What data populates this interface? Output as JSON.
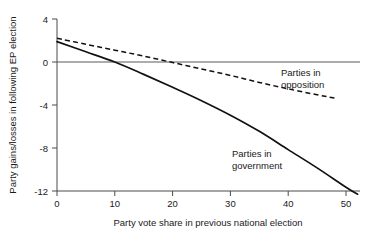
{
  "chart_data": {
    "type": "line",
    "title": "",
    "xlabel": "Party vote share in previous national election",
    "ylabel": "Party gains/losses in following EP election",
    "xlim": [
      -2,
      54
    ],
    "ylim": [
      -13.2,
      4.6
    ],
    "xticks": [
      0,
      10,
      20,
      30,
      40,
      50
    ],
    "xtick_labels": [
      "0",
      "10",
      "20",
      "30",
      "40",
      "50"
    ],
    "yticks": [
      4,
      0,
      -4,
      -8,
      -12
    ],
    "ytick_labels": [
      "4",
      "0",
      "-4",
      "-8",
      "-12"
    ],
    "grid": false,
    "legend": "annotations-inline",
    "zero_reference_line": 0,
    "series": [
      {
        "name": "Parties in government",
        "style": "solid",
        "color": "#111111",
        "annotation": "Parties in\ngovernment",
        "annotation_line1": "Parties in",
        "annotation_line2": "government",
        "x": [
          0,
          5,
          10,
          15,
          20,
          25,
          30,
          35,
          40,
          45,
          50,
          52
        ],
        "values": [
          1.9,
          0.95,
          0.0,
          -1.15,
          -2.35,
          -3.6,
          -4.95,
          -6.45,
          -8.15,
          -9.85,
          -11.65,
          -12.3
        ]
      },
      {
        "name": "Parties in opposition",
        "style": "dashed",
        "color": "#111111",
        "annotation": "Parties in\nopposition",
        "annotation_line1": "Parties in",
        "annotation_line2": "opposition",
        "x": [
          0,
          5,
          10,
          15,
          20,
          25,
          30,
          35,
          40,
          45,
          48
        ],
        "values": [
          2.2,
          1.65,
          1.1,
          0.55,
          -0.05,
          -0.65,
          -1.25,
          -1.9,
          -2.5,
          -3.05,
          -3.35
        ]
      }
    ]
  },
  "annotations": {
    "opposition_line1": "Parties in",
    "opposition_line2": "opposition",
    "government_line1": "Parties in",
    "government_line2": "government"
  },
  "axes": {
    "x_title": "Party vote share in previous national election",
    "y_title": "Party gains/losses in following EP election",
    "x_tick_0": "0",
    "x_tick_1": "10",
    "x_tick_2": "20",
    "x_tick_3": "30",
    "x_tick_4": "40",
    "x_tick_5": "50",
    "y_tick_0": "4",
    "y_tick_1": "0",
    "y_tick_2": "-4",
    "y_tick_3": "-8",
    "y_tick_4": "-12"
  }
}
